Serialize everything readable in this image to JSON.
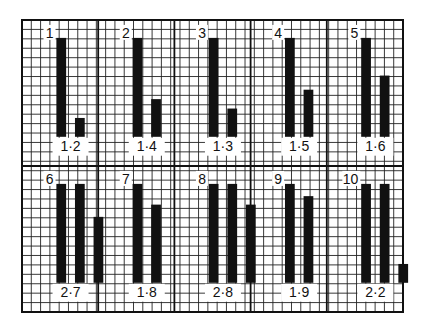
{
  "title": "",
  "grid": {
    "columns": 41,
    "rows": 31,
    "panel_columns": 5,
    "panel_rows": 2
  },
  "colors": {
    "ink": "#111111",
    "paper": "#ffffff",
    "grid": "#222222"
  },
  "chart_data": {
    "type": "bar",
    "title": "",
    "xlabel": "",
    "ylabel": "",
    "unit": "grid cells",
    "ylim": [
      0,
      12
    ],
    "panels": [
      {
        "id": "1",
        "label": "1",
        "ratio_label": "1·2",
        "bars": [
          10.5,
          2
        ]
      },
      {
        "id": "2",
        "label": "2",
        "ratio_label": "1·4",
        "bars": [
          10.5,
          4
        ]
      },
      {
        "id": "3",
        "label": "3",
        "ratio_label": "1·3",
        "bars": [
          10.5,
          3
        ]
      },
      {
        "id": "4",
        "label": "4",
        "ratio_label": "1·5",
        "bars": [
          10.5,
          5
        ]
      },
      {
        "id": "5",
        "label": "5",
        "ratio_label": "1·6",
        "bars": [
          10.5,
          6.5
        ]
      },
      {
        "id": "6",
        "label": "6",
        "ratio_label": "2·7",
        "bars": [
          10.5,
          10.5,
          7
        ]
      },
      {
        "id": "7",
        "label": "7",
        "ratio_label": "1·8",
        "bars": [
          10.5,
          8.3
        ]
      },
      {
        "id": "8",
        "label": "8",
        "ratio_label": "2·8",
        "bars": [
          10.5,
          10.5,
          8.3
        ]
      },
      {
        "id": "9",
        "label": "9",
        "ratio_label": "1·9",
        "bars": [
          10.5,
          9.2
        ]
      },
      {
        "id": "10",
        "label": "10",
        "ratio_label": "2·2",
        "bars": [
          10.5,
          10.5,
          2
        ]
      }
    ]
  }
}
